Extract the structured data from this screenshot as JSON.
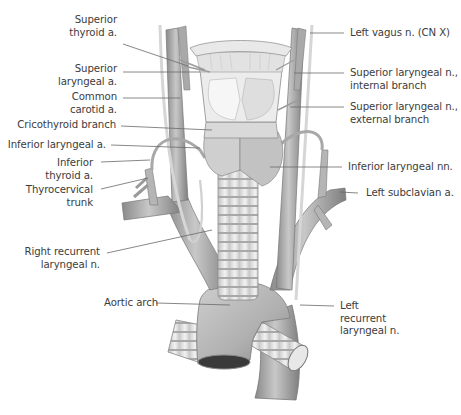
{
  "figure": {
    "colors": {
      "background": "#ffffff",
      "label_text": "#3c3c3c",
      "leader_line": "#6a6a6a",
      "vessel_fill": "#b9b9b9",
      "vessel_shade": "#8e8e8e",
      "cartilage_fill": "#e6e6e6",
      "nerve_fill": "#d8d8d8"
    }
  },
  "labels": {
    "left": [
      {
        "id": "superior-thyroid-a",
        "lines": [
          "Superior",
          "thyroid a."
        ]
      },
      {
        "id": "superior-laryngeal-a",
        "lines": [
          "Superior",
          "laryngeal a."
        ]
      },
      {
        "id": "common-carotid-a",
        "lines": [
          "Common",
          "carotid a."
        ]
      },
      {
        "id": "cricothyroid-branch",
        "lines": [
          "Cricothyroid branch"
        ]
      },
      {
        "id": "inferior-laryngeal-a",
        "lines": [
          "Inferior laryngeal a."
        ]
      },
      {
        "id": "inferior-thyroid-a",
        "lines": [
          "Inferior",
          "thyroid a."
        ]
      },
      {
        "id": "thyrocervical-trunk",
        "lines": [
          "Thyrocervical",
          "trunk"
        ]
      },
      {
        "id": "right-recurrent-laryngeal-n",
        "lines": [
          "Right recurrent",
          "laryngeal n."
        ]
      },
      {
        "id": "aortic-arch",
        "lines": [
          "Aortic arch"
        ]
      }
    ],
    "right": [
      {
        "id": "left-vagus-n",
        "lines": [
          "Left vagus n. (CN X)"
        ]
      },
      {
        "id": "superior-laryngeal-n-internal",
        "lines": [
          "Superior laryngeal n.,",
          "internal branch"
        ]
      },
      {
        "id": "superior-laryngeal-n-external",
        "lines": [
          "Superior laryngeal n.,",
          "external branch"
        ]
      },
      {
        "id": "inferior-laryngeal-nn",
        "lines": [
          "Inferior laryngeal nn."
        ]
      },
      {
        "id": "left-subclavian-a",
        "lines": [
          "Left subclavian a."
        ]
      },
      {
        "id": "left-recurrent-laryngeal-n",
        "lines": [
          "Left",
          "recurrent",
          "laryngeal n."
        ]
      }
    ]
  }
}
